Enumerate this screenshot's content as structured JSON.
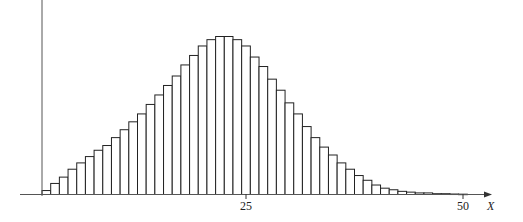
{
  "chart_data": {
    "type": "bar",
    "title": "",
    "xlabel": "X",
    "ylabel": "",
    "x_tick_labels": [
      "25",
      "50"
    ],
    "x_ticks": [
      25,
      50
    ],
    "grid": false,
    "legend": null,
    "bar_style": {
      "fill": "#ffffff",
      "stroke": "#222222",
      "width": 1
    },
    "categories": [
      2,
      3,
      4,
      5,
      6,
      7,
      8,
      9,
      10,
      11,
      12,
      13,
      14,
      15,
      16,
      17,
      18,
      19,
      20,
      21,
      22,
      23,
      24,
      25,
      26,
      27,
      28,
      29,
      30,
      31,
      32,
      33,
      34,
      35,
      36,
      37,
      38,
      39,
      40,
      41,
      42,
      43,
      44,
      45,
      46,
      47,
      48,
      49,
      50
    ],
    "values": [
      2.5,
      7,
      11,
      16,
      20,
      24,
      28,
      31,
      36,
      41,
      46,
      51,
      57,
      63,
      69,
      75,
      82,
      88,
      94,
      98,
      100,
      100,
      98,
      94,
      87,
      81,
      73,
      66,
      58,
      51,
      43,
      36,
      30,
      25,
      20,
      16,
      12,
      9,
      6,
      4,
      3,
      2,
      1.5,
      1,
      1,
      0.5,
      0.5,
      0.3,
      0.2
    ],
    "ylim": [
      0,
      105
    ],
    "xlim": [
      0,
      54
    ]
  },
  "axes": {
    "x_label": "X",
    "tick_25": "25",
    "tick_50": "50"
  }
}
